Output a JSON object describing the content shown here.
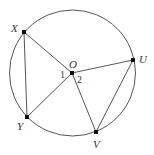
{
  "diagram": {
    "type": "circle-geometry",
    "colors": {
      "stroke": "#555555",
      "point": "#111111",
      "text": "#333333"
    },
    "circle": {
      "center": "O",
      "cx": 72.5,
      "cy": 73,
      "r": 63
    },
    "points": {
      "O": {
        "label": "O",
        "x": 72,
        "y": 73
      },
      "X": {
        "label": "X",
        "x": 24,
        "y": 32
      },
      "Y": {
        "label": "Y",
        "x": 27,
        "y": 117
      },
      "U": {
        "label": "U",
        "x": 133,
        "y": 60
      },
      "V": {
        "label": "V",
        "x": 96,
        "y": 132
      }
    },
    "angles": {
      "a1": {
        "label": "1",
        "between": "XOY"
      },
      "a2": {
        "label": "2",
        "between": "UOV"
      }
    },
    "segments": [
      "XY",
      "XO",
      "YO",
      "OU",
      "OV",
      "UV"
    ]
  }
}
